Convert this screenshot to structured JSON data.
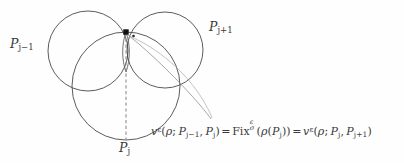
{
  "figure": {
    "width": 404,
    "height": 163,
    "background_color": "#fefefe",
    "stroke_color": "#4a4a4a",
    "thin_stroke_color": "#7a7a7a",
    "marker_color": "#111111",
    "dash_color": "#8c8c8c"
  },
  "labels": {
    "left_circle": "P",
    "left_circle_sub": "j−1",
    "right_circle": "P",
    "right_circle_sub": "j+1",
    "bottom_circle": "P",
    "bottom_circle_sub": "j"
  },
  "formula": {
    "full_text": "v^ε(ρ; P_{j−1}, P_j) = Fix_σ^ε(ρ(P_j)) = v^ε(ρ; P_j, P_{j+1})",
    "term1": {
      "fn": "v",
      "sup": "ε",
      "open": "(",
      "arg0": "ρ",
      "semicolon": ";",
      "arg1": "P",
      "arg1_sub": "j−1",
      "comma": ",",
      "arg2": "P",
      "arg2_sub": "j",
      "close": ")"
    },
    "eq1": "=",
    "term2": {
      "fn": "Fix",
      "sup": "ε",
      "sub": "σ",
      "open": "(",
      "arg0": "ρ",
      "open2": "(",
      "arg1": "P",
      "arg1_sub": "j",
      "close2": ")",
      "close": ")"
    },
    "eq2": "=",
    "term3": {
      "fn": "v",
      "sup": "ε",
      "open": "(",
      "arg0": "ρ",
      "semicolon": ";",
      "arg1": "P",
      "arg1_sub": "j",
      "comma": ",",
      "arg2": "P",
      "arg2_sub": "j+1",
      "close": ")"
    }
  },
  "geometry": {
    "circle_left": {
      "cx": 88,
      "cy": 51,
      "r": 40,
      "name": "circle-p-j-minus-1"
    },
    "circle_right": {
      "cx": 165,
      "cy": 50,
      "r": 38,
      "name": "circle-p-j-plus-1"
    },
    "circle_bottom": {
      "cx": 126,
      "cy": 86,
      "r": 54,
      "name": "circle-p-j"
    },
    "intersection_marker": {
      "x": 126,
      "y": 32,
      "size": 5
    },
    "small_dot": {
      "x": 133.5,
      "y": 36,
      "size": 2.2
    },
    "dashed_line": {
      "x": 126,
      "y1": 33,
      "y2": 140
    },
    "lens": {
      "x": 126,
      "top_y": 32,
      "bottom_y": 72,
      "half_width": 4.2
    },
    "geodesic_curve": "M 127 34 C 150 52, 178 80, 200 104 C 205 110, 209 115, 211 119",
    "arc_left_lower": "M 73 72 C 86 88, 106 99, 126 100",
    "arc_right_lower": "M 126 100 C 146 99, 166 88, 179 72"
  }
}
